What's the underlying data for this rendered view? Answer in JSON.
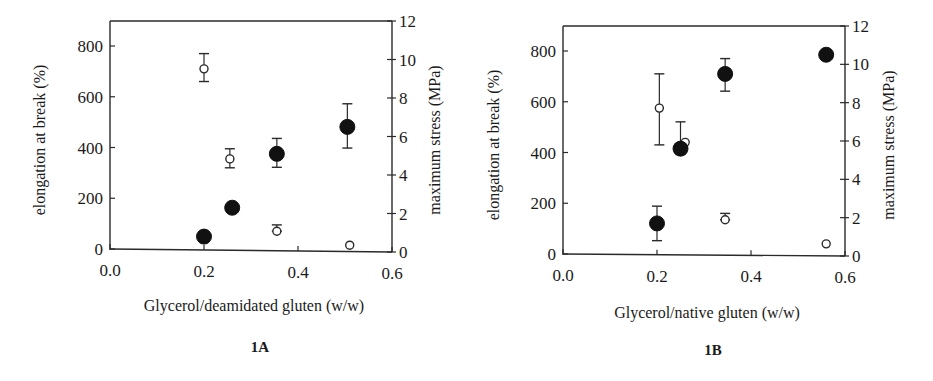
{
  "chart_data": [
    {
      "panel": "1A",
      "type": "scatter",
      "title": "",
      "xlabel": "Glycerol/deamidated gluten (w/w)",
      "ylabel": "elongation at break (%)",
      "y2label": "maximum stress (MPa)",
      "xlim": [
        0.0,
        0.6
      ],
      "ylim": [
        0,
        900
      ],
      "y2lim": [
        0,
        12
      ],
      "xticks": [
        "0.0",
        "0.2",
        "0.4",
        "0.6"
      ],
      "yticks": [
        "0",
        "200",
        "400",
        "600",
        "800"
      ],
      "y2ticks": [
        "0",
        "2",
        "4",
        "6",
        "8",
        "10",
        "12"
      ],
      "grid": false,
      "series": [
        {
          "name": "elongation at break (%)",
          "marker": "open-circle",
          "axis": "left",
          "points": [
            {
              "x": 0.2,
              "y": 710,
              "err_low": 660,
              "err_high": 770
            },
            {
              "x": 0.255,
              "y": 355,
              "err_low": 320,
              "err_high": 395
            },
            {
              "x": 0.355,
              "y": 70,
              "err_low": 70,
              "err_high": 95
            },
            {
              "x": 0.51,
              "y": 15,
              "err_low": 15,
              "err_high": 15
            }
          ]
        },
        {
          "name": "maximum stress (MPa)",
          "marker": "filled-circle",
          "axis": "right",
          "points": [
            {
              "x": 0.2,
              "y": 0.8,
              "err_low": 0.7,
              "err_high": 1.0
            },
            {
              "x": 0.26,
              "y": 2.3,
              "err_low": 2.1,
              "err_high": 2.5
            },
            {
              "x": 0.355,
              "y": 5.1,
              "err_low": 4.4,
              "err_high": 5.9
            },
            {
              "x": 0.505,
              "y": 6.5,
              "err_low": 5.4,
              "err_high": 7.7
            }
          ]
        }
      ]
    },
    {
      "panel": "1B",
      "type": "scatter",
      "title": "",
      "xlabel": "Glycerol/native gluten (w/w)",
      "ylabel": "elongation at break (%)",
      "y2label": "maximum stress (MPa)",
      "xlim": [
        0.0,
        0.6
      ],
      "ylim": [
        0,
        900
      ],
      "y2lim": [
        0,
        12
      ],
      "xticks": [
        "0.0",
        "0.2",
        "0.4",
        "0.6"
      ],
      "yticks": [
        "0",
        "200",
        "400",
        "600",
        "800"
      ],
      "y2ticks": [
        "0",
        "2",
        "4",
        "6",
        "8",
        "10",
        "12"
      ],
      "grid": false,
      "series": [
        {
          "name": "elongation at break (%)",
          "marker": "open-circle",
          "axis": "left",
          "points": [
            {
              "x": 0.205,
              "y": 575,
              "err_low": 430,
              "err_high": 710
            },
            {
              "x": 0.26,
              "y": 440,
              "err_low": 440,
              "err_high": 440
            },
            {
              "x": 0.345,
              "y": 135,
              "err_low": 135,
              "err_high": 160
            },
            {
              "x": 0.56,
              "y": 40,
              "err_low": 40,
              "err_high": 40
            }
          ]
        },
        {
          "name": "maximum stress (MPa)",
          "marker": "filled-circle",
          "axis": "right",
          "points": [
            {
              "x": 0.2,
              "y": 1.7,
              "err_low": 0.8,
              "err_high": 2.6
            },
            {
              "x": 0.25,
              "y": 5.6,
              "err_low": 5.3,
              "err_high": 7.0
            },
            {
              "x": 0.345,
              "y": 9.5,
              "err_low": 8.6,
              "err_high": 10.3
            },
            {
              "x": 0.56,
              "y": 10.5,
              "err_low": 10.5,
              "err_high": 10.5
            }
          ]
        }
      ]
    }
  ],
  "panels": {
    "a": {
      "label": "1A",
      "xlabel": "Glycerol/deamidated gluten (w/w)",
      "ylabel": "elongation at break (%)",
      "y2label": "maximum stress (MPa)"
    },
    "b": {
      "label": "1B",
      "xlabel": "Glycerol/native gluten (w/w)",
      "ylabel": "elongation at break (%)",
      "y2label": "maximum stress (MPa)"
    }
  }
}
